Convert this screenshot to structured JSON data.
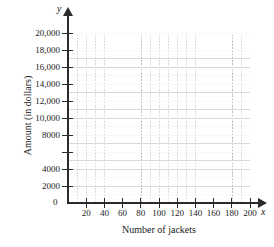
{
  "chart_data": {
    "type": "scatter",
    "title": "",
    "subtitle": "",
    "xlabel": "Number of jackets",
    "ylabel": "Amount (in dollars)",
    "x_axis_variable": "x",
    "y_axis_variable": "y",
    "origin_label": "0",
    "xlim": [
      0,
      200
    ],
    "ylim": [
      0,
      20000
    ],
    "x_major_step": 20,
    "x_minor_step": 10,
    "y_major_step": 2000,
    "y_minor_step": 1000,
    "grid": true,
    "minor_grid": true,
    "legend": "none",
    "series": [],
    "values": [],
    "categories": [],
    "annotations": [],
    "xticks": [
      {
        "value": 20,
        "label": "20"
      },
      {
        "value": 40,
        "label": "40"
      },
      {
        "value": 60,
        "label": "60"
      },
      {
        "value": 80,
        "label": "80"
      },
      {
        "value": 100,
        "label": "100"
      },
      {
        "value": 120,
        "label": "120"
      },
      {
        "value": 140,
        "label": "140"
      },
      {
        "value": 160,
        "label": "160"
      },
      {
        "value": 180,
        "label": "180"
      },
      {
        "value": 200,
        "label": "200"
      }
    ],
    "yticks": [
      {
        "value": 2000,
        "label": "2000"
      },
      {
        "value": 4000,
        "label": "4000"
      },
      {
        "value": 6000,
        "label": ""
      },
      {
        "value": 8000,
        "label": "8000"
      },
      {
        "value": 10000,
        "label": "10,000"
      },
      {
        "value": 12000,
        "label": "12,000"
      },
      {
        "value": 14000,
        "label": "14,000"
      },
      {
        "value": 16000,
        "label": "16,000"
      },
      {
        "value": 18000,
        "label": "18,000"
      },
      {
        "value": 20000,
        "label": "20,000"
      }
    ],
    "colors": {
      "background": "#ffffff",
      "axis": "#2b2b2b",
      "major_grid": "#bdbdbd",
      "minor_grid": "#d9d9d9",
      "text": "#1a1a1a"
    }
  }
}
